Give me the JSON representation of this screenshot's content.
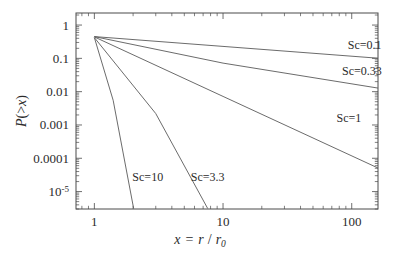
{
  "chart_data": {
    "type": "line",
    "title": "",
    "xlabel": "x = r / r_0",
    "ylabel": "P(>x)",
    "xscale": "log",
    "yscale": "log",
    "xlim": [
      0.72,
      160
    ],
    "ylim": [
      3e-06,
      2.3
    ],
    "grid": false,
    "legend_position": "inline-annotations",
    "x_tick_labels": [
      "1",
      "10",
      "100"
    ],
    "x_tick_values": [
      1,
      10,
      100
    ],
    "y_tick_labels": [
      "1",
      "0.1",
      "0.01",
      "0.001",
      "0.0001",
      "10",
      "-5"
    ],
    "y_tick_values": [
      1,
      0.1,
      0.01,
      0.001,
      0.0001,
      1e-05
    ],
    "origin_point": {
      "x": 1,
      "y": 0.45
    },
    "series": [
      {
        "name": "Sc=0.1",
        "label": "Sc=0.1",
        "label_x": 126,
        "label_y": 0.19,
        "points": [
          [
            1,
            0.45
          ],
          [
            160,
            0.101
          ]
        ]
      },
      {
        "name": "Sc=0.33",
        "label": "Sc=0.33",
        "label_x": 120,
        "label_y": 0.031,
        "points": [
          [
            1,
            0.45
          ],
          [
            10,
            0.072
          ],
          [
            160,
            0.0128
          ]
        ]
      },
      {
        "name": "Sc=1",
        "label": "Sc=1",
        "label_x": 95,
        "label_y": 0.0012,
        "points": [
          [
            1,
            0.44
          ],
          [
            10,
            0.0072
          ],
          [
            160,
            5.1e-05
          ]
        ]
      },
      {
        "name": "Sc=3.3",
        "label": "Sc=3.3",
        "label_x": 7.6,
        "label_y": 2.1e-05,
        "points": [
          [
            1,
            0.42
          ],
          [
            3,
            0.0022
          ],
          [
            7.6,
            3.1e-06
          ]
        ]
      },
      {
        "name": "Sc=10",
        "label": "Sc=10",
        "label_x": 2.6,
        "label_y": 2.1e-05,
        "points": [
          [
            1,
            0.42
          ],
          [
            1.4,
            0.0055
          ],
          [
            2.02,
            3.1e-06
          ]
        ]
      }
    ]
  },
  "axes": {
    "y_label_text": "P(>x)",
    "y_label_p": "P",
    "y_label_paren_open": "(",
    "y_label_gt": ">",
    "y_label_x": "x",
    "y_label_paren_close": ")",
    "x_label_x": "x",
    "x_label_eq": "=",
    "x_label_r": "r",
    "x_label_slash": "/",
    "x_label_r0": "r",
    "x_label_sub0": "0"
  },
  "style": {
    "background": "#ffffff",
    "frame_color": "#4a4a4a",
    "curve_color": "#5a5a5a",
    "text_color": "#2b2b2b"
  }
}
